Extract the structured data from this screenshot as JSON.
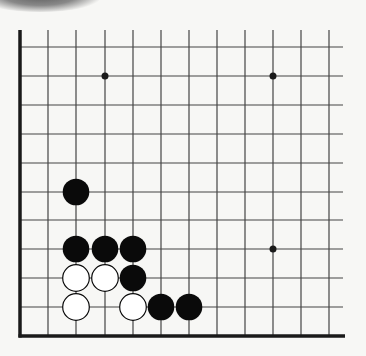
{
  "diagram": {
    "type": "go-board-corner",
    "colors": {
      "background": "#f7f7f5",
      "line": "#444444",
      "edge": "#1a1a1a",
      "black_stone": "#0a0a0a",
      "white_stone": "#ffffff"
    },
    "grid": {
      "columns_x": [
        20,
        48,
        76,
        105,
        133,
        161,
        189,
        217,
        245,
        273,
        301,
        329
      ],
      "rows_y": [
        47,
        76,
        105,
        134,
        163,
        192,
        220,
        249,
        278,
        307,
        336
      ],
      "left_edge_x": 20,
      "bottom_edge_y": 336,
      "top_y": 30,
      "right_x": 343
    },
    "star_points": [
      {
        "col": 3,
        "row": 1
      },
      {
        "col": 9,
        "row": 1
      },
      {
        "col": 9,
        "row": 7
      }
    ],
    "stones": [
      {
        "color": "black",
        "col": 2,
        "row": 5
      },
      {
        "color": "black",
        "col": 2,
        "row": 7
      },
      {
        "color": "black",
        "col": 3,
        "row": 7
      },
      {
        "color": "black",
        "col": 4,
        "row": 7
      },
      {
        "color": "white",
        "col": 2,
        "row": 8
      },
      {
        "color": "white",
        "col": 3,
        "row": 8
      },
      {
        "color": "black",
        "col": 4,
        "row": 8
      },
      {
        "color": "white",
        "col": 2,
        "row": 9
      },
      {
        "color": "white",
        "col": 4,
        "row": 9
      },
      {
        "color": "black",
        "col": 5,
        "row": 9
      },
      {
        "color": "black",
        "col": 6,
        "row": 9
      }
    ]
  }
}
